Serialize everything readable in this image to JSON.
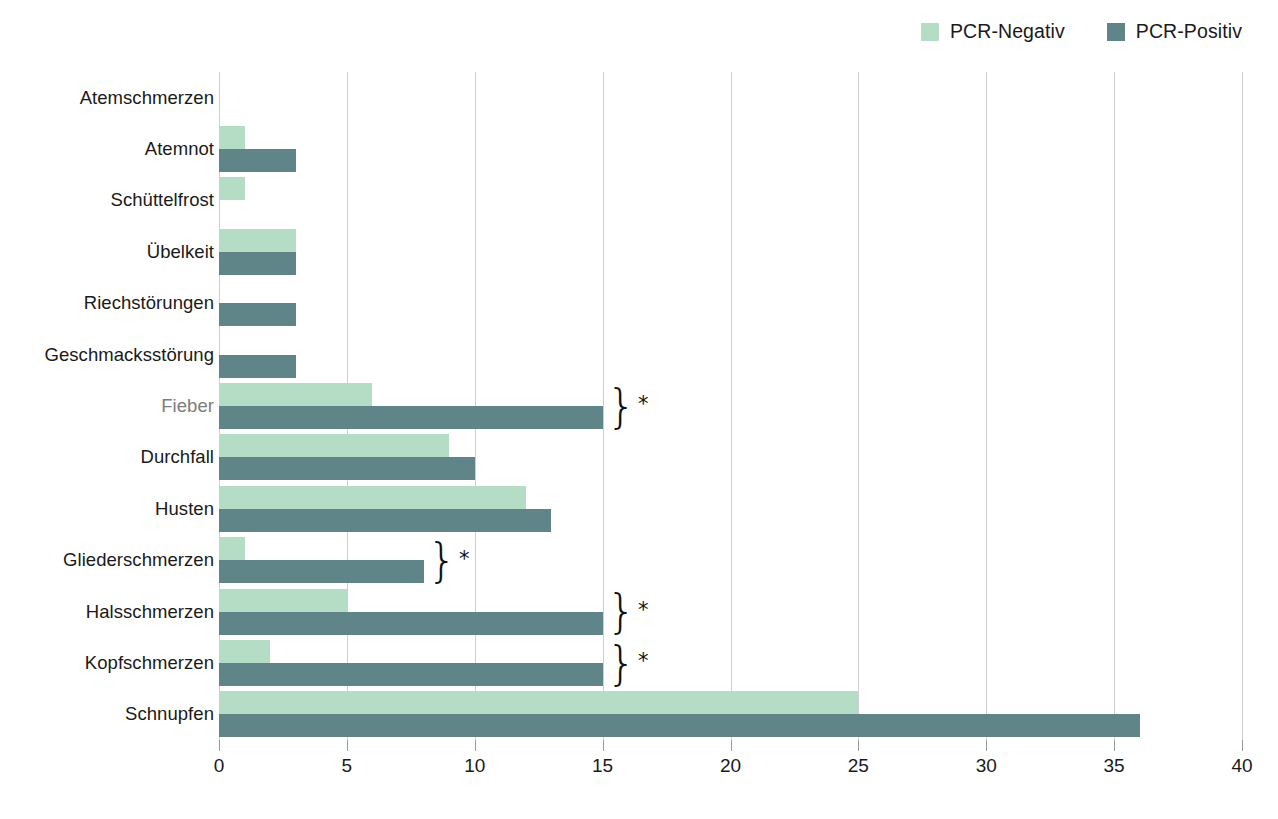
{
  "chart_data": {
    "type": "bar",
    "orientation": "horizontal",
    "title": "",
    "subtitle": "",
    "xlabel": "",
    "ylabel": "",
    "xlim": [
      0,
      40
    ],
    "xticks": [
      0,
      5,
      10,
      15,
      20,
      25,
      30,
      35,
      40
    ],
    "grid": "vertical",
    "legend_position": "top-right",
    "categories": [
      "Atemschmerzen",
      "Atemnot",
      "Schüttelfrost",
      "Übelkeit",
      "Riechstörungen",
      "Geschmacksstörung",
      "Fieber",
      "Durchfall",
      "Husten",
      "Gliederschmerzen",
      "Halsschmerzen",
      "Kopfschmerzen",
      "Schnupfen"
    ],
    "series": [
      {
        "name": "PCR-Negativ",
        "color": "#b5dcc4",
        "values": [
          0,
          1,
          1,
          3,
          0,
          0,
          6,
          9,
          12,
          1,
          5,
          2,
          25
        ]
      },
      {
        "name": "PCR-Positiv",
        "color": "#5f8588",
        "values": [
          0,
          3,
          0,
          3,
          3,
          3,
          15,
          10,
          13,
          8,
          15,
          15,
          36
        ]
      }
    ],
    "annotations": [
      {
        "category": "Fieber",
        "marker": "*",
        "bracket": true
      },
      {
        "category": "Gliederschmerzen",
        "marker": "*",
        "bracket": true
      },
      {
        "category": "Halsschmerzen",
        "marker": "*",
        "bracket": true
      },
      {
        "category": "Kopfschmerzen",
        "marker": "*",
        "bracket": true
      }
    ],
    "dimmed_categories": [
      "Fieber"
    ]
  },
  "legend": {
    "items": [
      {
        "label": "PCR-Negativ",
        "color": "#b5dcc4"
      },
      {
        "label": "PCR-Positiv",
        "color": "#5f8588"
      }
    ]
  },
  "axis": {
    "x_tick_labels": [
      "0",
      "5",
      "10",
      "15",
      "20",
      "25",
      "30",
      "35",
      "40"
    ]
  },
  "colors": {
    "negative": "#b5dcc4",
    "positive": "#5f8588",
    "gridline": "#cfcfcf",
    "text": "#1a1a1a",
    "text_dim": "#7d7d7d",
    "background": "#ffffff"
  }
}
